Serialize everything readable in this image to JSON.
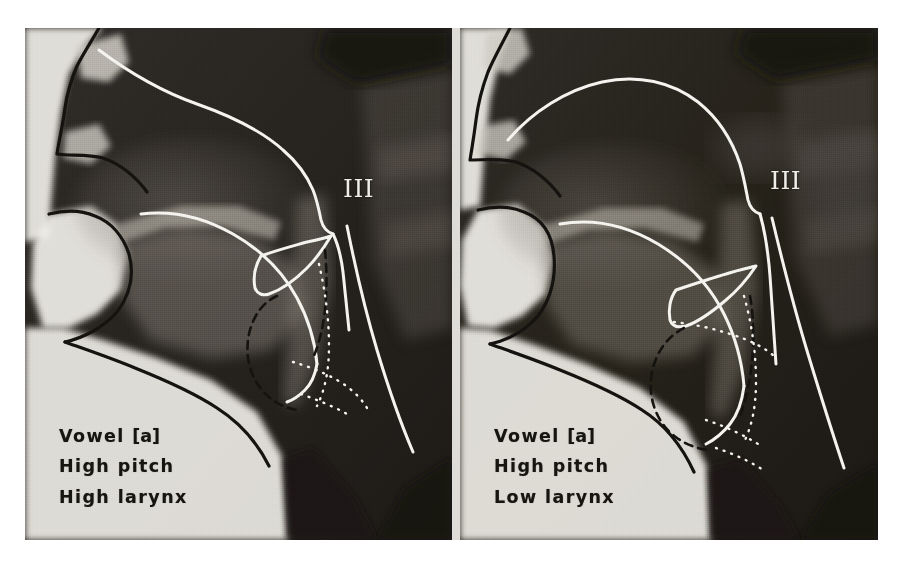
{
  "figure": {
    "kind": "lateral-xray-radiograph-pair",
    "background_color": "#ffffff",
    "plate_background": "#f2f1ee",
    "film_dark": "#24211f",
    "trace_line_color": "#f4f3ee",
    "soft_tissue_outline_color": "#151310",
    "caption_color": "#17150f"
  },
  "panels": [
    {
      "id": "left",
      "position": "left",
      "caption": {
        "line1_prefix": "Vowel",
        "line1_symbol": "[a]",
        "line2": "High pitch",
        "line3": "High larynx"
      },
      "marker": {
        "label": "III",
        "meaning": "cervical-vertebra-three",
        "color": "#efeee9"
      }
    },
    {
      "id": "right",
      "position": "right",
      "caption": {
        "line1_prefix": "Vowel",
        "line1_symbol": "[a]",
        "line2": "High pitch",
        "line3": "Low larynx"
      },
      "marker": {
        "label": "III",
        "meaning": "cervical-vertebra-three",
        "color": "#efeee9"
      }
    }
  ]
}
